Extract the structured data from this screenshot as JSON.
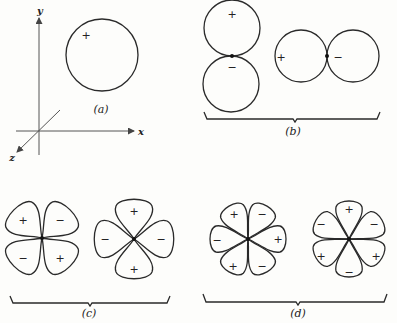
{
  "figure": {
    "panels": {
      "a": {
        "label": "(a)",
        "axes": {
          "x": "x",
          "y": "y",
          "z": "z"
        },
        "shape": "single circle (s-type)",
        "signs": [
          "+"
        ]
      },
      "b": {
        "label": "(b)",
        "shape": "two-lobe pairs (p-type)",
        "vertical_pair_signs": [
          "+",
          "−"
        ],
        "horizontal_pair_signs": [
          "+",
          "−"
        ]
      },
      "c": {
        "label": "(c)",
        "shape": "four-lobe cloverleaf (d-type)",
        "diagonal_signs": [
          "+",
          "−",
          "−",
          "+"
        ],
        "axial_signs": [
          "+",
          "−",
          "−",
          "+"
        ]
      },
      "d": {
        "label": "(d)",
        "shape": "six-lobe (f-type)",
        "left_signs": [
          "+",
          "−",
          "−",
          "+",
          "+",
          "−"
        ],
        "right_signs": [
          "+",
          "−",
          "−",
          "+",
          "+",
          "−"
        ]
      }
    }
  }
}
